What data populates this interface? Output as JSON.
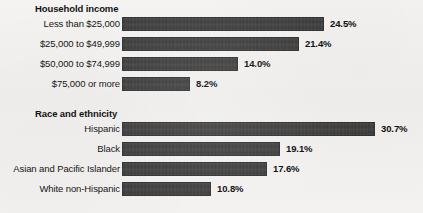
{
  "chart_data": {
    "type": "bar",
    "orientation": "horizontal",
    "title": "",
    "xlabel": "",
    "ylabel": "",
    "xlim": [
      0,
      32
    ],
    "grid": false,
    "legend": null,
    "value_suffix": "%",
    "sections": [
      {
        "title": "Household income",
        "categories": [
          "Less than $25,000",
          "$25,000 to $49,999",
          "$50,000 to $74,999",
          "$75,000 or more"
        ],
        "values": [
          24.5,
          21.4,
          14.0,
          8.2
        ],
        "value_labels": [
          "24.5%",
          "21.4%",
          "14.0%",
          "8.2%"
        ]
      },
      {
        "title": "Race and ethnicity",
        "categories": [
          "Hispanic",
          "Black",
          "Asian and Pacific Islander",
          "White non-Hispanic"
        ],
        "values": [
          30.7,
          19.1,
          17.6,
          10.8
        ],
        "value_labels": [
          "30.7%",
          "19.1%",
          "17.6%",
          "10.8%"
        ]
      }
    ]
  },
  "style": {
    "bar_color": "#3a3a3a",
    "background_color": "#f2f1ef",
    "text_color": "#161616"
  }
}
